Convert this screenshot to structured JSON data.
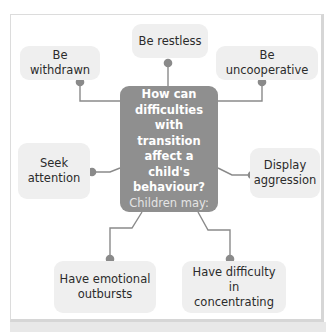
{
  "diagram": {
    "center": {
      "question": "How can difficulties with transition affect a child's behaviour?",
      "question_lines": [
        "How can",
        "difficulties",
        "with transition",
        "affect a child's",
        "behaviour?"
      ],
      "subtitle": "Children may:"
    },
    "nodes": [
      {
        "id": "be-restless",
        "label": "Be restless"
      },
      {
        "id": "be-withdrawn",
        "label": "Be withdrawn"
      },
      {
        "id": "be-uncooperative",
        "label": "Be uncooperative"
      },
      {
        "id": "seek-attention",
        "label": "Seek attention",
        "lines": [
          "Seek",
          "attention"
        ]
      },
      {
        "id": "display-aggression",
        "label": "Display aggression",
        "lines": [
          "Display",
          "aggression"
        ]
      },
      {
        "id": "have-emotional-outbursts",
        "label": "Have emotional outbursts",
        "lines": [
          "Have emotional",
          "outbursts"
        ]
      },
      {
        "id": "have-difficulty-concentrating",
        "label": "Have difficulty in concentrating",
        "lines": [
          "Have difficulty in",
          "concentrating"
        ]
      }
    ],
    "colors": {
      "center_fill": "#8f8f8f",
      "node_fill": "#efefef",
      "connector": "#8a8a8a",
      "dot": "#8a8a8a"
    }
  }
}
